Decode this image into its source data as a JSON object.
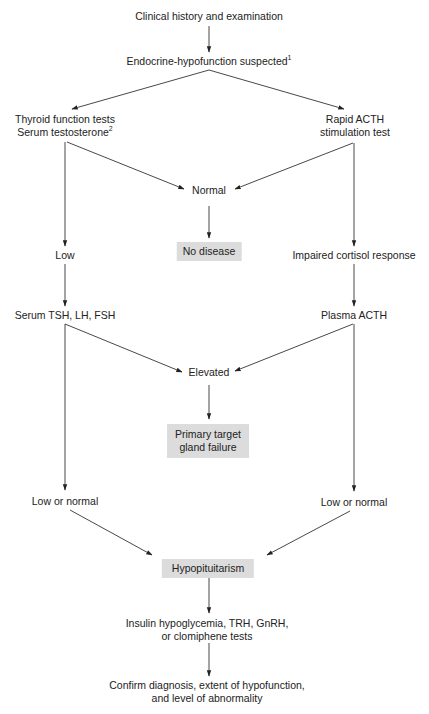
{
  "diagram": {
    "type": "flowchart",
    "colors": {
      "line": "#333333",
      "text": "#222222",
      "highlight_box": "#dcdcdc",
      "background": "#ffffff"
    },
    "nodes": {
      "start": {
        "text": "Clinical history and examination"
      },
      "suspected": {
        "text": "Endocrine-hypofunction suspected",
        "footnote": "1"
      },
      "thyroid_tests": {
        "line1": "Thyroid function tests",
        "line2": "Serum testosterone",
        "footnote": "2"
      },
      "acth_test": {
        "line1": "Rapid ACTH",
        "line2": "stimulation test"
      },
      "normal": {
        "text": "Normal"
      },
      "no_disease": {
        "text": "No disease",
        "highlighted": true
      },
      "low": {
        "text": "Low"
      },
      "impaired": {
        "text": "Impaired cortisol response"
      },
      "serum_tsh": {
        "text": "Serum TSH, LH, FSH"
      },
      "plasma_acth": {
        "text": "Plasma ACTH"
      },
      "elevated": {
        "text": "Elevated"
      },
      "primary_failure": {
        "line1": "Primary target",
        "line2": "gland failure",
        "highlighted": true
      },
      "low_normal_left": {
        "text": "Low or normal"
      },
      "low_normal_right": {
        "text": "Low or normal"
      },
      "hypopituitarism": {
        "text": "Hypopituitarism",
        "highlighted": true
      },
      "insulin_tests": {
        "line1": "Insulin hypoglycemia, TRH, GnRH,",
        "line2": "or clomiphene tests"
      },
      "confirm": {
        "line1": "Confirm diagnosis, extent of hypofunction,",
        "line2": "and level of abnormality"
      }
    },
    "edges": [
      {
        "from": "start",
        "to": "suspected"
      },
      {
        "from": "suspected",
        "to": "thyroid_tests"
      },
      {
        "from": "suspected",
        "to": "acth_test"
      },
      {
        "from": "thyroid_tests",
        "to": "normal"
      },
      {
        "from": "acth_test",
        "to": "normal"
      },
      {
        "from": "normal",
        "to": "no_disease"
      },
      {
        "from": "thyroid_tests",
        "to": "low"
      },
      {
        "from": "acth_test",
        "to": "impaired"
      },
      {
        "from": "low",
        "to": "serum_tsh"
      },
      {
        "from": "impaired",
        "to": "plasma_acth"
      },
      {
        "from": "serum_tsh",
        "to": "elevated"
      },
      {
        "from": "plasma_acth",
        "to": "elevated"
      },
      {
        "from": "elevated",
        "to": "primary_failure"
      },
      {
        "from": "serum_tsh",
        "to": "low_normal_left"
      },
      {
        "from": "plasma_acth",
        "to": "low_normal_right"
      },
      {
        "from": "low_normal_left",
        "to": "hypopituitarism"
      },
      {
        "from": "low_normal_right",
        "to": "hypopituitarism"
      },
      {
        "from": "hypopituitarism",
        "to": "insulin_tests"
      },
      {
        "from": "insulin_tests",
        "to": "confirm"
      }
    ]
  }
}
